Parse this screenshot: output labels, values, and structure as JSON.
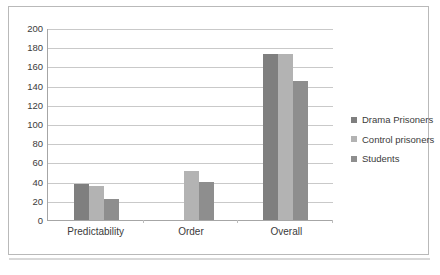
{
  "chart_data": {
    "type": "bar",
    "title": "",
    "subtitle": "",
    "xlabel": "",
    "ylabel": "",
    "categories": [
      "Predictability",
      "Order",
      "Overall"
    ],
    "series": [
      {
        "name": "Drama Prisoners",
        "color": "#7f7f7f",
        "values": [
          37,
          0,
          173
        ]
      },
      {
        "name": "Control prisoners",
        "color": "#b3b3b3",
        "values": [
          35,
          51,
          173
        ]
      },
      {
        "name": "Students",
        "color": "#8e8e8e",
        "values": [
          22,
          40,
          145
        ]
      }
    ],
    "ylim": [
      0,
      200
    ],
    "ytick_step": 20,
    "yticks": [
      0,
      20,
      40,
      60,
      80,
      100,
      120,
      140,
      160,
      180,
      200
    ],
    "grid": true,
    "grid_axis": "y",
    "legend_position": "right"
  },
  "legend": {
    "items": [
      {
        "label": "Drama Prisoners"
      },
      {
        "label": "Control prisoners"
      },
      {
        "label": "Students"
      }
    ]
  },
  "axis": {
    "y_tick_labels": [
      "200",
      "180",
      "160",
      "140",
      "120",
      "100",
      "80",
      "60",
      "40",
      "20",
      "0"
    ],
    "x_tick_labels": [
      "Predictability",
      "Order",
      "Overall"
    ]
  }
}
